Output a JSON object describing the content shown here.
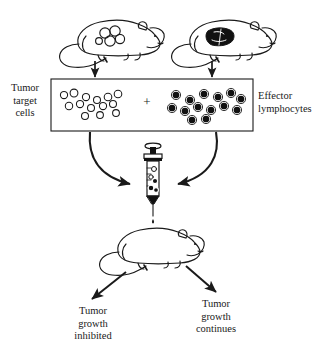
{
  "figure": {
    "labels": {
      "tumor_target_cells": "Tumor\ntarget\ncells",
      "effector_lymphocytes": "Effector\nlymphocytes",
      "plus": "+",
      "growth_inhibited": "Tumor\ngrowth\ninhibited",
      "growth_continues": "Tumor\ngrowth\ncontinues"
    },
    "elements": {
      "mouse_tumor_bearing": "tumor-bearing-mouse",
      "mouse_immunized": "immunized-mouse",
      "mixing_box": "cell-mixture-box",
      "open_cells": "tumor-target-cell-circles",
      "filled_cells": "effector-lymphocyte-dots",
      "syringe": "syringe-with-cell-mixture",
      "recipient_mouse": "recipient-mouse",
      "arrow_left_down": "arrow-from-tumor-mouse",
      "arrow_right_down": "arrow-from-immunized-mouse",
      "curve_left": "curved-arrow-left-to-syringe",
      "curve_right": "curved-arrow-right-to-syringe",
      "needle_drop": "injection-drop",
      "arrow_outcome_left": "arrow-to-growth-inhibited",
      "arrow_outcome_right": "arrow-to-growth-continues"
    },
    "counts": {
      "open_cells": 12,
      "filled_cells": 13
    },
    "colors": {
      "ink": "#1a1a1a",
      "background": "#ffffff",
      "fill_dark": "#111111"
    }
  }
}
